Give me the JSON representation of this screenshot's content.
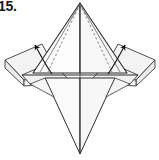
{
  "figure": {
    "step_label": "15.",
    "caption": "",
    "type": "origami-fold-diagram",
    "background_color": "#ffffff",
    "line_color": "#2b2b2b",
    "fold_line_color": "#6e6e6e",
    "arrow_color": "#111111",
    "paper_front_color": "#fcfcfc",
    "paper_shade_color": "#f0f0f0",
    "paper_shade_color_2": "#e7e7e7",
    "apex": {
      "x": 80,
      "y": 3
    },
    "bottom_point": {
      "x": 80,
      "y": 154
    },
    "left_point": {
      "x": 5,
      "y": 60
    },
    "right_point": {
      "x": 155,
      "y": 60
    },
    "arrows": [
      {
        "name": "left-fold-arrow",
        "direction": "up-left",
        "tail": {
          "x": 50,
          "y": 72
        },
        "head": {
          "x": 32,
          "y": 41
        }
      },
      {
        "name": "right-fold-arrow",
        "direction": "up-right",
        "tail": {
          "x": 110,
          "y": 72
        },
        "head": {
          "x": 128,
          "y": 41
        }
      }
    ],
    "dotted_fold_lines": [
      {
        "name": "left-inner-valley-fold",
        "from": {
          "x": 80,
          "y": 4
        },
        "to": {
          "x": 44,
          "y": 71
        }
      },
      {
        "name": "right-inner-valley-fold",
        "from": {
          "x": 80,
          "y": 4
        },
        "to": {
          "x": 116,
          "y": 71
        }
      }
    ],
    "solid_creases": [
      {
        "name": "center-vertical-crease",
        "from": {
          "x": 80,
          "y": 4
        },
        "to": {
          "x": 80,
          "y": 154
        }
      },
      {
        "name": "left-outer-crease",
        "from": {
          "x": 80,
          "y": 4
        },
        "to": {
          "x": 33,
          "y": 72
        }
      },
      {
        "name": "right-outer-crease",
        "from": {
          "x": 80,
          "y": 4
        },
        "to": {
          "x": 127,
          "y": 72
        }
      },
      {
        "name": "horizontal-base-crease",
        "from": {
          "x": 22,
          "y": 75
        },
        "to": {
          "x": 138,
          "y": 75
        }
      }
    ]
  }
}
